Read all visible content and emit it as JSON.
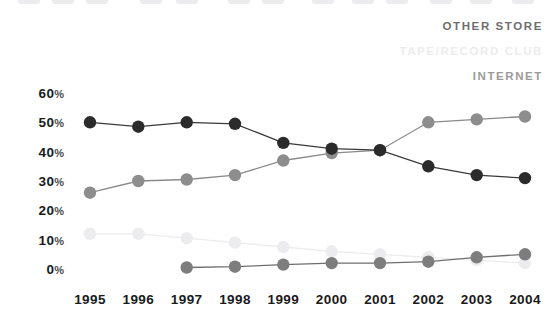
{
  "legend": {
    "items": [
      {
        "label": "OTHER STORE",
        "key": "other_store",
        "color": "#6e6e6e"
      },
      {
        "label": "TAPE/RECORD CLUB",
        "key": "tape_record_club",
        "color": "#ececed"
      },
      {
        "label": "INTERNET",
        "key": "internet",
        "color": "#9a9a9a"
      }
    ]
  },
  "chart_data": {
    "type": "line",
    "title": "",
    "subtitle": "",
    "xlabel": "",
    "ylabel": "",
    "grid": false,
    "legend_position": "top-right",
    "x": [
      "1995",
      "1996",
      "1997",
      "1998",
      "1999",
      "2000",
      "2001",
      "2002",
      "2003",
      "2004"
    ],
    "ytick_values": [
      0,
      10,
      20,
      30,
      40,
      50,
      60
    ],
    "ytick_labels": [
      "0%",
      "10%",
      "20%",
      "30%",
      "40%",
      "50%",
      "60%"
    ],
    "ylim": [
      0,
      60
    ],
    "series": [
      {
        "name": "OTHER STORE",
        "color": "#2b2b2b",
        "line_color": "#3a3a3a",
        "values": [
          50,
          48.5,
          50,
          49.5,
          43,
          41,
          40.5,
          35,
          32,
          31
        ]
      },
      {
        "name": "INTERNET",
        "color": "#8d8d8d",
        "line_color": "#8a8a8a",
        "values": [
          26,
          30,
          30.5,
          32,
          37,
          39.5,
          40.5,
          50,
          51,
          52
        ]
      },
      {
        "name": "TAPE/RECORD CLUB",
        "color": "#ececee",
        "line_color": "#ececee",
        "values": [
          12,
          12,
          10.5,
          9,
          7.5,
          6,
          5,
          4,
          3,
          2
        ]
      },
      {
        "name": "MAIL ORDER",
        "color": "#7d7d7d",
        "line_color": "#6f6f6f",
        "values": [
          null,
          null,
          0.5,
          0.8,
          1.5,
          2,
          2,
          2.5,
          4,
          5
        ]
      }
    ]
  },
  "axes": {
    "y_percent_suffix": "%"
  }
}
